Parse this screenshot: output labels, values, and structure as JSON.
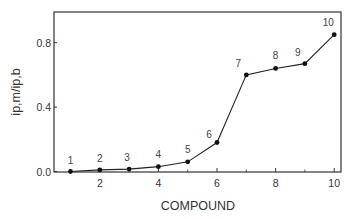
{
  "chart_data": {
    "type": "line",
    "title": "",
    "xlabel": "COMPOUND",
    "ylabel": "ip,m/ip,b",
    "x": [
      1,
      2,
      3,
      4,
      5,
      6,
      7,
      8,
      9,
      10
    ],
    "series": [
      {
        "name": "ip,m/ip,b",
        "values": [
          0.0,
          0.01,
          0.015,
          0.03,
          0.06,
          0.18,
          0.6,
          0.64,
          0.67,
          0.85
        ],
        "point_labels": [
          "1",
          "2",
          "3",
          "4",
          "5",
          "6",
          "7",
          "8",
          "9",
          "10"
        ]
      }
    ],
    "xlim": [
      0.5,
      10.2
    ],
    "ylim": [
      0.0,
      1.0
    ],
    "xticks": [
      2,
      4,
      6,
      8,
      10
    ],
    "xtick_labels": [
      "2",
      "4",
      "6",
      "8",
      "10"
    ],
    "yticks": [
      0.0,
      0.4,
      0.8
    ],
    "ytick_labels": [
      "0.0",
      "0.4",
      "0.8"
    ],
    "grid": false,
    "legend": null,
    "frame": "box"
  }
}
